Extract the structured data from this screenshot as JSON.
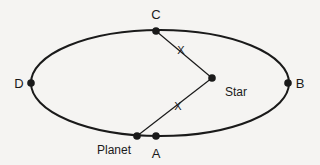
{
  "diagram": {
    "background_color": "#f5f4f2",
    "stroke_color": "#1a1a1a",
    "orbit": {
      "name": "orbit-ellipse",
      "cx": 160,
      "cy": 83,
      "rx": 129,
      "ry": 53,
      "stroke_width": 2
    },
    "points": [
      {
        "id": "C",
        "label": "C",
        "x": 156,
        "y": 31,
        "label_x": 156,
        "label_y": 14,
        "kind": "orbit-point"
      },
      {
        "id": "B",
        "label": "B",
        "x": 288,
        "y": 83,
        "label_x": 300,
        "label_y": 83,
        "kind": "orbit-point"
      },
      {
        "id": "D",
        "label": "D",
        "x": 31,
        "y": 83,
        "label_x": 19,
        "label_y": 83,
        "kind": "orbit-point"
      },
      {
        "id": "A",
        "label": "A",
        "x": 156,
        "y": 136,
        "label_x": 156,
        "label_y": 153,
        "kind": "orbit-point"
      },
      {
        "id": "Planet",
        "label": "Planet",
        "x": 137,
        "y": 136,
        "label_x": 114,
        "label_y": 150,
        "kind": "body"
      },
      {
        "id": "Star",
        "label": "Star",
        "x": 212,
        "y": 78,
        "label_x": 236,
        "label_y": 92,
        "kind": "body"
      }
    ],
    "dot_radius": 3.8,
    "segments": [
      {
        "name": "segment-c-to-star",
        "from": "C",
        "to": "Star",
        "label": "X",
        "label_x": 181,
        "label_y": 50,
        "stroke_width": 1.2
      },
      {
        "name": "segment-star-to-planet",
        "from": "Star",
        "to": "Planet",
        "label": "X",
        "label_x": 178,
        "label_y": 106,
        "stroke_width": 1.2
      }
    ],
    "distance_label": "X"
  }
}
